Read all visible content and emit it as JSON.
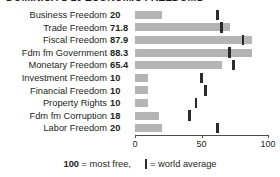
{
  "chart_data": {
    "type": "bar",
    "title": "DOMINICA'S 10 ECONOMIC FREEDOMS",
    "xlabel": "",
    "ylabel": "",
    "xlim": [
      0,
      100
    ],
    "ticks": [
      0,
      50,
      100
    ],
    "tick_labels": [
      "0",
      "50",
      "100"
    ],
    "grid": false,
    "orientation": "horizontal",
    "legend_position": "bottom",
    "categories": [
      "Business Freedom",
      "Trade Freedom",
      "Fiscal Freedom",
      "Fdm fm Government",
      "Monetary Freedom",
      "Investment Freedom",
      "Financial Freedom",
      "Property Rights",
      "Fdm fm Corruption",
      "Labor Freedom"
    ],
    "series": [
      {
        "name": "Dominica score",
        "values": [
          20,
          71.8,
          87.9,
          88.3,
          65.4,
          10,
          10,
          10,
          18,
          20
        ],
        "value_labels": [
          "20",
          "71.8",
          "87.9",
          "88.3",
          "65.4",
          "10",
          "10",
          "10",
          "18",
          "20"
        ],
        "color": "#b4b4b4"
      },
      {
        "name": "world average",
        "values": [
          62,
          65,
          81,
          71,
          74,
          50,
          53,
          46,
          41,
          62
        ],
        "color": "#2b2b2b",
        "marker": "vertical-tick"
      }
    ]
  },
  "legend": {
    "scale_note_bold": "100",
    "scale_note_rest": " = most free,",
    "marker_label": "= world average"
  }
}
